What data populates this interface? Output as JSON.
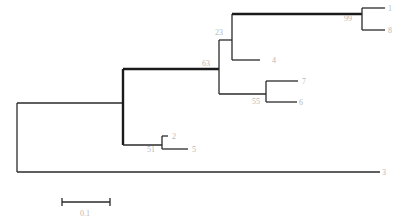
{
  "tree": {
    "type": "phylogenetic-tree",
    "tips": [
      {
        "id": "tip-a",
        "label": "1"
      },
      {
        "id": "tip-b",
        "label": "8"
      },
      {
        "id": "tip-c",
        "label": "4"
      },
      {
        "id": "tip-d",
        "label": "7"
      },
      {
        "id": "tip-e",
        "label": "6"
      },
      {
        "id": "tip-f",
        "label": "2"
      },
      {
        "id": "tip-g",
        "label": "5"
      },
      {
        "id": "tip-h",
        "label": "3"
      }
    ],
    "support": {
      "node_99": "99",
      "node_23": "23",
      "node_63": "63",
      "node_55": "55",
      "node_51": "51"
    },
    "scale_bar": {
      "label": "0.1"
    }
  }
}
